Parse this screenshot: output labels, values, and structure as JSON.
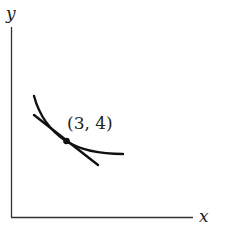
{
  "diagram": {
    "type": "indifference-curve-with-tangent",
    "axes": {
      "x_label": "x",
      "y_label": "y"
    },
    "point": {
      "label": "(3, 4)",
      "x": 3,
      "y": 4
    },
    "elements": [
      {
        "kind": "curve",
        "description": "convex decreasing curve"
      },
      {
        "kind": "line",
        "description": "tangent line to curve at point"
      },
      {
        "kind": "point",
        "description": "tangency point"
      }
    ],
    "colors": {
      "stroke": "#111111",
      "text": "#222222",
      "background": "#ffffff"
    }
  }
}
